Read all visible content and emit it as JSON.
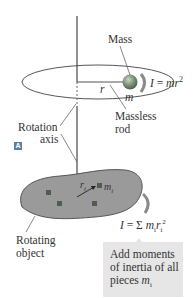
{
  "figure": {
    "panel_label": "A",
    "labels": {
      "mass": "Mass",
      "massless_rod_line1": "Massless",
      "massless_rod_line2": "rod",
      "rotation_axis_line1": "Rotation",
      "rotation_axis_line2": "axis",
      "rotating_object_line1": "Rotating",
      "rotating_object_line2": "object",
      "radius_symbol": "r",
      "mass_symbol": "m",
      "piece_radius_symbol": "r",
      "piece_radius_subscript": "i",
      "piece_mass_symbol": "m",
      "piece_mass_subscript": "i"
    },
    "equations": {
      "point_mass": {
        "lhs": "I",
        "eq": " = ",
        "rhs": "mr",
        "sup": "2"
      },
      "extended": {
        "lhs": "I",
        "eq": " = Σ ",
        "m": "m",
        "m_sub": "i",
        "r": "r",
        "r_sub": "i",
        "sup": "2"
      }
    },
    "note": {
      "line1": "Add moments",
      "line2": "of inertia of all",
      "line3_text": "pieces ",
      "line3_symbol": "m",
      "line3_sub": "i"
    },
    "colors": {
      "object_fill": "#9a9a9a",
      "sphere": "#6f8a6f",
      "note_bg": "#e6e6e6",
      "panel_tag": "#5a7fa8"
    }
  }
}
